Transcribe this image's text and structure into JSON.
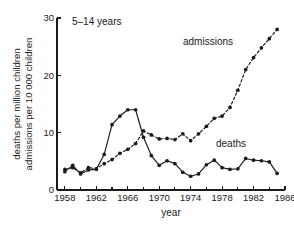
{
  "figure": {
    "panel_title": "5–14 years",
    "background_color": "#ffffff",
    "ink_color": "#1a1a1a"
  },
  "labels": {
    "admissions_label": "admissions",
    "deaths_label": "deaths",
    "xlabel": "year",
    "ylabel_line1": "deaths per million children",
    "ylabel_line2": "admissions per 10 000 children"
  },
  "axes": {
    "y_ticks": [
      "0",
      "10",
      "20",
      "30"
    ],
    "x_ticks": [
      "1958",
      "1962",
      "1966",
      "1970",
      "1974",
      "1978",
      "1982",
      "1986"
    ],
    "x_minor_ticks": [
      "1960",
      "1964",
      "1968",
      "1972",
      "1976",
      "1980",
      "1984"
    ]
  },
  "chart_data": {
    "type": "line",
    "title": "5–14 years",
    "xlabel": "year",
    "ylabel": "deaths per million children / admissions per 10 000 children",
    "xlim": [
      1957,
      1986
    ],
    "ylim": [
      0,
      30
    ],
    "grid": false,
    "legend_position": "inline-annotation",
    "x": [
      1958,
      1959,
      1960,
      1961,
      1962,
      1963,
      1964,
      1965,
      1966,
      1967,
      1968,
      1969,
      1970,
      1971,
      1972,
      1973,
      1974,
      1975,
      1976,
      1977,
      1978,
      1979,
      1980,
      1981,
      1982,
      1983,
      1984,
      1985
    ],
    "series": [
      {
        "name": "deaths",
        "style": "solid",
        "units": "deaths per million children",
        "values": [
          3.2,
          4.3,
          2.8,
          3.5,
          3.6,
          6.2,
          11.4,
          12.9,
          14.0,
          14.0,
          9.2,
          6.0,
          4.3,
          5.1,
          4.6,
          3.1,
          2.4,
          2.8,
          4.4,
          5.2,
          3.9,
          3.6,
          3.7,
          5.5,
          5.2,
          5.1,
          4.9,
          2.9
        ]
      },
      {
        "name": "admissions",
        "style": "dashed",
        "units": "admissions per 10 000 children",
        "values": [
          3.6,
          3.9,
          3.0,
          3.9,
          3.7,
          4.6,
          5.3,
          6.4,
          7.1,
          8.1,
          10.3,
          9.6,
          8.9,
          9.0,
          8.8,
          9.8,
          8.6,
          9.8,
          11.1,
          12.5,
          12.9,
          14.4,
          17.4,
          21.0,
          23.1,
          24.8,
          26.4,
          28.0
        ]
      }
    ]
  },
  "geometry": {
    "plot_left": 57,
    "plot_right": 285,
    "plot_top": 18,
    "plot_bottom": 190
  }
}
